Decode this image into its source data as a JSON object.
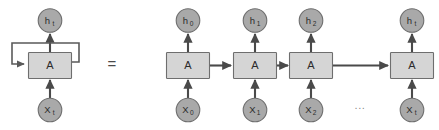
{
  "figure": {
    "equals_symbol": "=",
    "ellipsis": "...",
    "colors": {
      "background": "#ffffff",
      "circle_fill": "#a9a9a9",
      "circle_stroke": "#6e6e6e",
      "box_fill": "#d5d5d5",
      "box_stroke": "#6e6e6e",
      "arrow": "#4a4a4a",
      "loop": "#5a5a5a",
      "text": "#2b2b2b",
      "ellipsis_text": "#8a8a8a"
    }
  },
  "rolled": {
    "name": "rolled-rnn",
    "output": {
      "base": "h",
      "sub": "t"
    },
    "cell": {
      "label": "A"
    },
    "input": {
      "base": "X",
      "sub": "t"
    },
    "self_loop": {
      "name": "recurrent-self-loop"
    }
  },
  "unrolled": {
    "name": "unrolled-rnn",
    "steps": [
      {
        "output": {
          "base": "h",
          "sub": "0"
        },
        "cell": {
          "label": "A"
        },
        "input": {
          "base": "X",
          "sub": "0"
        }
      },
      {
        "output": {
          "base": "h",
          "sub": "1"
        },
        "cell": {
          "label": "A"
        },
        "input": {
          "base": "X",
          "sub": "1"
        }
      },
      {
        "output": {
          "base": "h",
          "sub": "2"
        },
        "cell": {
          "label": "A"
        },
        "input": {
          "base": "X",
          "sub": "2"
        }
      },
      {
        "output": {
          "base": "h",
          "sub": "t"
        },
        "cell": {
          "label": "A"
        },
        "input": {
          "base": "X",
          "sub": "t"
        }
      }
    ]
  }
}
